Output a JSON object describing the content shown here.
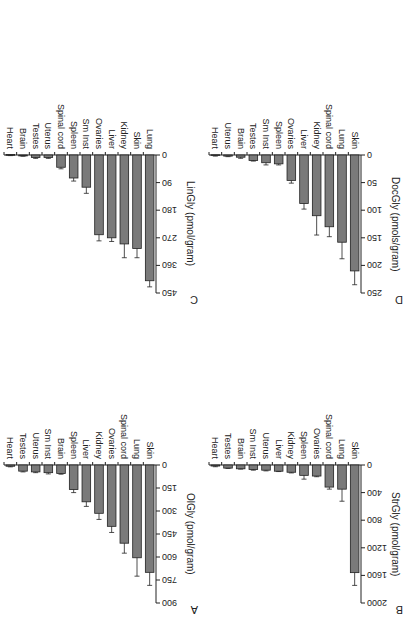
{
  "figure": {
    "orientation": "rotated 180 degrees",
    "bar_color": "#7a7a7a",
    "bar_stroke": "#222222",
    "axis_color": "#222222"
  },
  "chart_data": [
    {
      "panel": "A",
      "type": "bar",
      "title": "",
      "ylabel": "OlGly (pmol/gram)",
      "xlabel": "",
      "ylim": [
        0,
        900
      ],
      "yticks": [
        0,
        150,
        300,
        450,
        600,
        750,
        900
      ],
      "categories": [
        "Skin",
        "Lung",
        "Spinal cord",
        "Ovaries",
        "Kidney",
        "Liver",
        "Spleen",
        "Brain",
        "Sm Inst",
        "Uterus",
        "Testes",
        "Heart"
      ],
      "values": [
        700,
        605,
        510,
        400,
        315,
        240,
        160,
        55,
        50,
        45,
        40,
        8
      ],
      "errors": [
        85,
        120,
        65,
        40,
        40,
        30,
        20,
        5,
        8,
        5,
        5,
        4
      ],
      "grid": false,
      "legend": null
    },
    {
      "panel": "B",
      "type": "bar",
      "title": "",
      "ylabel": "StrGly (pmol/gram)",
      "xlabel": "",
      "ylim": [
        0,
        2000
      ],
      "yticks": [
        0,
        400,
        800,
        1200,
        1600,
        2000
      ],
      "categories": [
        "Skin",
        "Lung",
        "Spinal cord",
        "Ovaries",
        "Spleen",
        "Kidney",
        "Liver",
        "Uterus",
        "Sm Inst",
        "Brain",
        "Testes",
        "Heart"
      ],
      "values": [
        1560,
        350,
        320,
        160,
        150,
        105,
        90,
        75,
        65,
        55,
        45,
        15
      ],
      "errors": [
        185,
        175,
        30,
        10,
        55,
        10,
        5,
        10,
        10,
        5,
        5,
        10
      ],
      "grid": false,
      "legend": null
    },
    {
      "panel": "C",
      "type": "bar",
      "title": "",
      "ylabel": "LinGly (pmol/gram)",
      "xlabel": "",
      "ylim": [
        0,
        450
      ],
      "yticks": [
        0,
        90,
        180,
        270,
        360,
        450
      ],
      "categories": [
        "Lung",
        "Skin",
        "Kidney",
        "Liver",
        "Ovaries",
        "Sm Inst",
        "Spleen",
        "Spinal cord",
        "Uterus",
        "Testes",
        "Brain",
        "Heart"
      ],
      "values": [
        410,
        305,
        290,
        270,
        260,
        105,
        75,
        40,
        8,
        8,
        3,
        1
      ],
      "errors": [
        20,
        30,
        45,
        12,
        20,
        20,
        10,
        5,
        3,
        3,
        1,
        1
      ],
      "grid": false,
      "legend": null
    },
    {
      "panel": "D",
      "type": "bar",
      "title": "",
      "ylabel": "DocGly (pmols/gram)",
      "xlabel": "",
      "ylim": [
        0,
        250
      ],
      "yticks": [
        0,
        50,
        100,
        150,
        200,
        250
      ],
      "categories": [
        "Skin",
        "Lung",
        "Spinal cord",
        "Kidney",
        "Liver",
        "Ovaries",
        "Spleen",
        "Sm Inst",
        "Testes",
        "Brain",
        "Uterus",
        "Heart"
      ],
      "values": [
        210,
        158,
        130,
        110,
        88,
        46,
        16,
        14,
        10,
        4,
        2,
        1
      ],
      "errors": [
        25,
        30,
        18,
        35,
        10,
        5,
        2,
        4,
        1,
        2,
        1,
        1
      ],
      "grid": false,
      "legend": null
    }
  ]
}
